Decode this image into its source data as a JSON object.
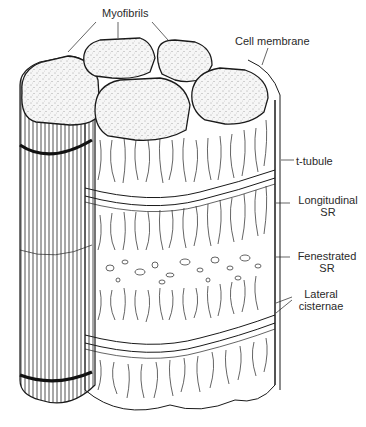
{
  "figure": {
    "type": "anatomical line drawing"
  },
  "labels": {
    "myofibrils": "Myofibrils",
    "cell_membrane": "Cell membrane",
    "t_tubule": "t-tubule",
    "longitudinal_sr_line1": "Longitudinal",
    "longitudinal_sr_line2": "SR",
    "fenestrated_sr_line1": "Fenestrated",
    "fenestrated_sr_line2": "SR",
    "lateral_cisternae_line1": "Lateral",
    "lateral_cisternae_line2": "cisternae"
  },
  "caption": {
    "text": "",
    "truncated": true
  },
  "colors": {
    "ink": "#1a1a1a",
    "stipple_fill": "#f3f3f3",
    "background": "#ffffff"
  }
}
